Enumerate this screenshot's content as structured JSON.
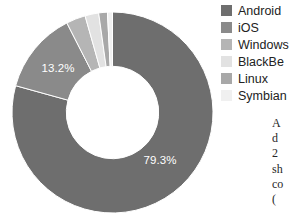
{
  "chart_data": {
    "type": "pie",
    "variant": "donut",
    "title": "",
    "subtitle": "",
    "xlabel": "",
    "ylabel": "",
    "legend_position": "right",
    "grid": false,
    "start_angle_deg": 0,
    "direction": "clockwise",
    "inner_radius_ratio": 0.46,
    "categories": [
      "Android",
      "iOS",
      "Windows",
      "BlackBerry",
      "Linux",
      "Symbian"
    ],
    "values": [
      79.3,
      13.2,
      3.1,
      2.2,
      1.4,
      0.8
    ],
    "value_suffix": "%",
    "colors": [
      "#6e6e6e",
      "#8a8a8a",
      "#b5b5b5",
      "#e2e2e2",
      "#a8a8a8",
      "#f0f0f0"
    ],
    "slices": [
      {
        "label": "Android",
        "value": 79.3,
        "display": "79.3%",
        "color": "#6e6e6e",
        "label_shown": true,
        "label_color": "#ffffff"
      },
      {
        "label": "iOS",
        "value": 13.2,
        "display": "13.2%",
        "color": "#8a8a8a",
        "label_shown": true,
        "label_color": "#ffffff"
      },
      {
        "label": "Windows",
        "value": 3.1,
        "display": "3.1%",
        "color": "#b5b5b5",
        "label_shown": false,
        "label_color": "#ffffff"
      },
      {
        "label": "BlackBerry",
        "value": 2.2,
        "display": "2.2%",
        "color": "#e2e2e2",
        "label_shown": false,
        "label_color": "#ffffff"
      },
      {
        "label": "Linux",
        "value": 1.4,
        "display": "1.4%",
        "color": "#a8a8a8",
        "label_shown": false,
        "label_color": "#ffffff"
      },
      {
        "label": "Symbian",
        "value": 0.8,
        "display": "0.8%",
        "color": "#f0f0f0",
        "label_shown": false,
        "label_color": "#ffffff"
      }
    ],
    "data_labels": [
      {
        "text": "79.3%",
        "x": 160,
        "y": 164
      },
      {
        "text": "13.2%",
        "x": 58,
        "y": 72
      }
    ]
  },
  "legend": {
    "items": [
      {
        "label": "Android",
        "color": "#6e6e6e"
      },
      {
        "label": "iOS",
        "color": "#8a8a8a"
      },
      {
        "label": "Windows",
        "color": "#b5b5b5"
      },
      {
        "label": "BlackBe",
        "color": "#e2e2e2"
      },
      {
        "label": "Linux",
        "color": "#a8a8a8"
      },
      {
        "label": "Symbian",
        "color": "#f0f0f0"
      }
    ]
  },
  "caption": {
    "lines": [
      "A",
      "d",
      "2",
      "sh",
      "co",
      "("
    ]
  }
}
